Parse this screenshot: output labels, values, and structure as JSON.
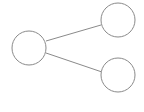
{
  "diagram": {
    "type": "tree",
    "background": "#ffffff",
    "stroke_color": "#8a8a8a",
    "stroke_width": 1,
    "nodes": [
      {
        "id": "root",
        "cx": 29,
        "cy": 48,
        "r": 17,
        "label": ""
      },
      {
        "id": "child-top",
        "cx": 118,
        "cy": 20,
        "r": 17,
        "label": ""
      },
      {
        "id": "child-bottom",
        "cx": 118,
        "cy": 75,
        "r": 17,
        "label": ""
      }
    ],
    "edges": [
      {
        "from": "root",
        "to": "child-top",
        "x1": 46,
        "y1": 41,
        "x2": 101,
        "y2": 25
      },
      {
        "from": "root",
        "to": "child-bottom",
        "x1": 46,
        "y1": 53,
        "x2": 102,
        "y2": 72
      }
    ]
  }
}
